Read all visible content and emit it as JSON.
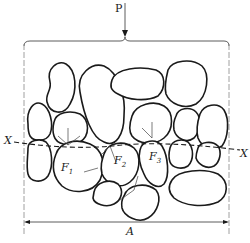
{
  "diagram": {
    "type": "granular-force-chain",
    "labels": {
      "load": "P",
      "axis_left": "X",
      "axis_right": "X",
      "force1": "F",
      "force1_sub": "1",
      "force2": "F",
      "force2_sub": "2",
      "force3": "F",
      "force3_sub": "3",
      "width": "A"
    },
    "colors": {
      "ink": "#1a1a1a",
      "background": "#ffffff"
    }
  }
}
